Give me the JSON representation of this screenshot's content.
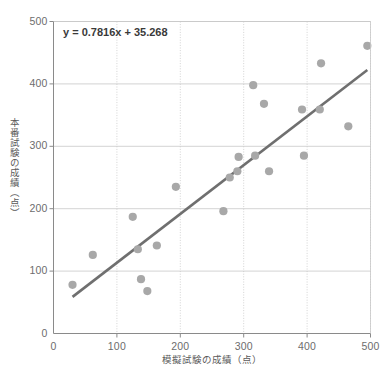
{
  "chart_data": {
    "type": "scatter",
    "title": "",
    "xlabel": "模擬試験の成績（点）",
    "ylabel": "本番試験の成績（点）",
    "xlim": [
      0,
      500
    ],
    "ylim": [
      0,
      500
    ],
    "xticks": [
      0,
      100,
      200,
      300,
      400,
      500
    ],
    "yticks": [
      0,
      100,
      200,
      300,
      400,
      500
    ],
    "xtick_labels": [
      "0",
      "100",
      "200",
      "300",
      "400",
      "500"
    ],
    "ytick_labels": [
      "0",
      "100",
      "200",
      "300",
      "400",
      "500"
    ],
    "grid": true,
    "legend": null,
    "annotation": "y = 0.7816x + 35.268",
    "marker_color": "#a8a8a8",
    "trendline_color": "#6f6f6f",
    "grid_color": "#c8c8c8",
    "axis_color": "#8a8a8a",
    "trendline": {
      "slope": 0.7816,
      "intercept": 35.268,
      "x_start": 30,
      "x_end": 495
    },
    "points": [
      {
        "x": 30,
        "y": 78
      },
      {
        "x": 62,
        "y": 126
      },
      {
        "x": 125,
        "y": 187
      },
      {
        "x": 133,
        "y": 135
      },
      {
        "x": 138,
        "y": 87
      },
      {
        "x": 148,
        "y": 68
      },
      {
        "x": 163,
        "y": 141
      },
      {
        "x": 193,
        "y": 235
      },
      {
        "x": 268,
        "y": 196
      },
      {
        "x": 278,
        "y": 250
      },
      {
        "x": 290,
        "y": 260
      },
      {
        "x": 292,
        "y": 283
      },
      {
        "x": 315,
        "y": 398
      },
      {
        "x": 318,
        "y": 285
      },
      {
        "x": 332,
        "y": 368
      },
      {
        "x": 340,
        "y": 260
      },
      {
        "x": 392,
        "y": 359
      },
      {
        "x": 395,
        "y": 285
      },
      {
        "x": 420,
        "y": 359
      },
      {
        "x": 422,
        "y": 433
      },
      {
        "x": 465,
        "y": 332
      },
      {
        "x": 495,
        "y": 461
      }
    ]
  }
}
